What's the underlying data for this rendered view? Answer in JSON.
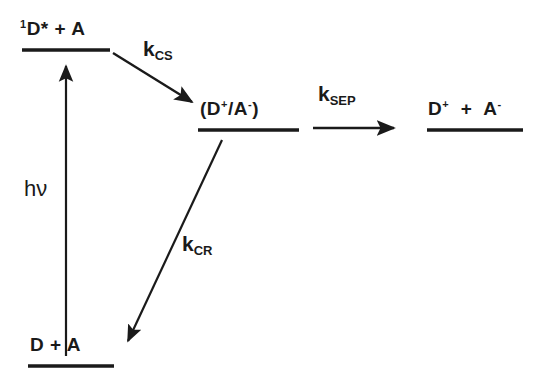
{
  "diagram": {
    "background_color": "#ffffff",
    "ink_color": "#1a1a1a",
    "states": [
      {
        "id": "excited",
        "name": "singlet-excited-donor-acceptor",
        "label_html": "<sup>1</sup>D* + A",
        "label_text": "1D* + A",
        "level_line": {
          "x1": 22,
          "x2": 110,
          "y": 50
        }
      },
      {
        "id": "ctstate",
        "name": "charge-transfer-ion-pair",
        "label_html": "(D<sup>+</sup>/A<sup>-</sup>)",
        "label_text": "(D+/A-)",
        "level_line": {
          "x1": 198,
          "x2": 299,
          "y": 130
        }
      },
      {
        "id": "separated",
        "name": "free-ion-separated-state",
        "label_html": "D<sup>+</sup> &nbsp;+&nbsp; A<sup>-</sup>",
        "label_text": "D+ + A-",
        "level_line": {
          "x1": 427,
          "x2": 523,
          "y": 130
        }
      },
      {
        "id": "ground",
        "name": "ground-state-donor-acceptor",
        "label_html": "D + A",
        "label_text": "D + A",
        "level_line": {
          "x1": 28,
          "x2": 114,
          "y": 366
        }
      }
    ],
    "processes": [
      {
        "id": "kcs",
        "name": "charge-separation-rate",
        "label_html": "k<sub>CS</sub>",
        "label_text": "kCS",
        "arrow": {
          "x1": 113,
          "y1": 53,
          "x2": 196,
          "y2": 105,
          "type": "diagonal-down-right"
        }
      },
      {
        "id": "ksep",
        "name": "ion-separation-rate",
        "label_html": "k<sub>SEP</sub>",
        "label_text": "kSEP",
        "arrow": {
          "x1": 313,
          "y1": 128,
          "x2": 398,
          "y2": 128,
          "type": "horizontal-right"
        }
      },
      {
        "id": "kcr",
        "name": "charge-recombination-rate",
        "label_html": "k<sub>CR</sub>",
        "label_text": "kCR",
        "arrow": {
          "x1": 222,
          "y1": 140,
          "x2": 124,
          "y2": 348,
          "type": "diagonal-down-left"
        }
      },
      {
        "id": "hv",
        "name": "photon-excitation",
        "label_html": "h&#957;",
        "label_text": "hv",
        "arrow": {
          "x1": 66,
          "y1": 356,
          "x2": 66,
          "y2": 62,
          "type": "vertical-up"
        }
      }
    ]
  }
}
